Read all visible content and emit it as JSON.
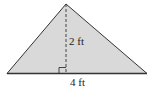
{
  "diagram": {
    "shape": "triangle",
    "fill_color": "#d9d9d9",
    "stroke_color": "#333333",
    "vertices": {
      "apex": [
        66,
        4
      ],
      "left": [
        7,
        73.5
      ],
      "right": [
        147,
        73.5
      ]
    },
    "height_label": "2 ft",
    "base_label": "4 ft",
    "height_line_style": "dashed",
    "right_angle_marker": true
  }
}
